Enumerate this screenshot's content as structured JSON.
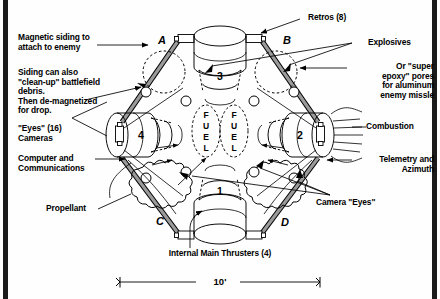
{
  "figure": {
    "scale_label": "10'",
    "corner_labels": [
      "A",
      "B",
      "C",
      "D"
    ],
    "thruster_numbers": [
      "1",
      "2",
      "3",
      "4"
    ],
    "fuel_label_left": "FUEL",
    "fuel_label_right": "FUEL"
  },
  "callouts": {
    "left": [
      {
        "name": "magnetic-siding",
        "text": "Magnetic siding to\nattach to enemy"
      },
      {
        "name": "siding-cleanup",
        "text": "Siding can also\n\"clean-up\" battlefield\ndebris.\nThen de-magnetized\nfor drop."
      },
      {
        "name": "eyes-cameras",
        "text": "\"Eyes\" (16)\nCameras"
      },
      {
        "name": "computer-communications",
        "text": "Computer and\nCommunications"
      },
      {
        "name": "propellant",
        "text": "Propellant"
      }
    ],
    "right": [
      {
        "name": "retros",
        "text": "Retros (8)"
      },
      {
        "name": "explosives",
        "text": "Explosives"
      },
      {
        "name": "super-epoxy",
        "text": "Or \"super\nepoxy\" pores\nfor aluminum\nenemy missle"
      },
      {
        "name": "combustion",
        "text": "Combustion"
      },
      {
        "name": "telemetry-azimuth",
        "text": "Telemetry and\nAzimuth"
      },
      {
        "name": "camera-eyes",
        "text": "Camera \"Eyes\""
      }
    ],
    "bottom": [
      {
        "name": "internal-main-thrusters",
        "text": "Internal Main Thrusters (4)"
      }
    ]
  },
  "colors": {
    "ink": "#000000",
    "paper": "#fefefe",
    "frame": "#1a1a1a",
    "siding_fill": "#8a8a8a",
    "dashed": "#333333"
  }
}
